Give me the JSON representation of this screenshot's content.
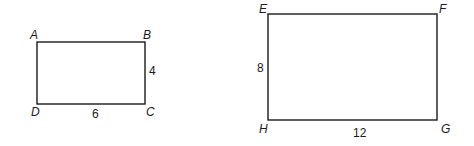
{
  "figure": {
    "rect1": {
      "name": "ABCD",
      "vertices": {
        "A": "A",
        "B": "B",
        "C": "C",
        "D": "D"
      },
      "side_labels": {
        "BC": "4",
        "DC": "6"
      }
    },
    "rect2": {
      "name": "EFGH",
      "vertices": {
        "E": "E",
        "F": "F",
        "G": "G",
        "H": "H"
      },
      "side_labels": {
        "EH": "8",
        "HG": "12"
      }
    },
    "colors": {
      "stroke": "#1a1a1a",
      "background": "#ffffff"
    }
  }
}
